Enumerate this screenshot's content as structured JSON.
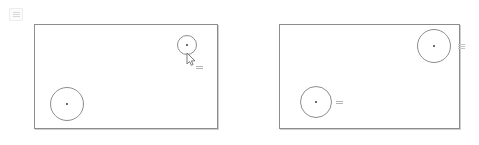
{
  "app": {
    "title": "Canvas comparison",
    "background_color": "#ffffff"
  },
  "corner_badge": {
    "name": "menu-badge",
    "label": ""
  },
  "panels": [
    {
      "id": "left",
      "name": "canvas-panel-left",
      "frame": {
        "x": 34,
        "y": 24,
        "width": 184,
        "height": 105,
        "stroke_color": "#8d8d8d"
      },
      "ghost_label": "",
      "shapes": [
        {
          "name": "circle-large",
          "type": "circle",
          "cx": 67,
          "cy": 104,
          "r": 17,
          "stroke_color": "#8d8d8d",
          "center_dot_color": "#6d6d6d"
        },
        {
          "name": "circle-small",
          "type": "circle",
          "cx": 187,
          "cy": 45,
          "r": 10,
          "stroke_color": "#8d8d8d",
          "center_dot_color": "#6d6d6d"
        }
      ],
      "cursor": {
        "name": "mouse-cursor",
        "x": 186,
        "y": 52,
        "color": "#7a7a7a"
      },
      "markers": [
        {
          "name": "tooltip-chip",
          "x": 196,
          "y": 64
        }
      ]
    },
    {
      "id": "right",
      "name": "canvas-panel-right",
      "frame": {
        "x": 279,
        "y": 24,
        "width": 181,
        "height": 105,
        "stroke_color": "#8d8d8d"
      },
      "ghost_label": "",
      "shapes": [
        {
          "name": "circle-large",
          "type": "circle",
          "cx": 316,
          "cy": 102,
          "r": 16,
          "stroke_color": "#8d8d8d",
          "center_dot_color": "#6d6d6d"
        },
        {
          "name": "circle-small",
          "type": "circle",
          "cx": 434,
          "cy": 46,
          "r": 17,
          "stroke_color": "#8d8d8d",
          "center_dot_color": "#6d6d6d"
        }
      ],
      "cursor": null,
      "markers": [
        {
          "name": "label-chip",
          "x": 336,
          "y": 99
        },
        {
          "name": "edge-handle-chip",
          "x": 458,
          "y": 43
        }
      ]
    }
  ]
}
